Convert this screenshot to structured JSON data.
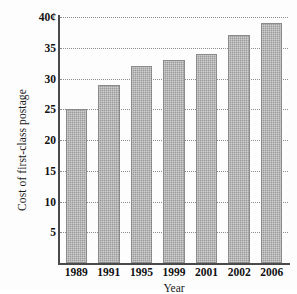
{
  "chart_data": {
    "type": "bar",
    "title": "",
    "xlabel": "Year",
    "ylabel": "Cost of first-class postage",
    "categories": [
      "1989",
      "1991",
      "1995",
      "1999",
      "2001",
      "2002",
      "2006"
    ],
    "values": [
      25,
      29,
      32,
      33,
      34,
      37,
      39
    ],
    "ylim": [
      0,
      40
    ],
    "ytick_labels": [
      "5",
      "10",
      "15",
      "20",
      "25",
      "30",
      "35",
      "40¢"
    ],
    "ytick_values": [
      5,
      10,
      15,
      20,
      25,
      30,
      35,
      40
    ],
    "grid": true,
    "grid_style": "dotted-horizontal",
    "legend": "none",
    "bar_color": "#9a9a9a",
    "axis_color": "#4a4a4a",
    "gridline_color": "#8d8d8d",
    "unit": "cents"
  }
}
